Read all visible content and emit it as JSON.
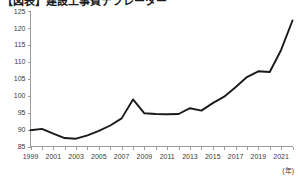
{
  "chart_data": {
    "type": "line",
    "title": "【図表】建設工事費デフレーター",
    "xlabel": "(年)",
    "ylabel": "",
    "ylim": [
      85,
      125
    ],
    "ytick_step": 5,
    "yticks": [
      85,
      90,
      95,
      100,
      105,
      110,
      115,
      120,
      125
    ],
    "xlim": [
      1999,
      2022
    ],
    "xticks_labeled": [
      "1999",
      "2001",
      "2003",
      "2005",
      "2007",
      "2009",
      "2011",
      "2013",
      "2015",
      "2017",
      "2019",
      "2021"
    ],
    "x": [
      1999,
      2000,
      2001,
      2002,
      2003,
      2004,
      2005,
      2006,
      2007,
      2008,
      2009,
      2010,
      2011,
      2012,
      2013,
      2014,
      2015,
      2016,
      2017,
      2018,
      2019,
      2020,
      2021,
      2022
    ],
    "values": [
      89.8,
      90.2,
      88.8,
      87.5,
      87.3,
      88.3,
      89.6,
      91.2,
      93.3,
      98.9,
      94.8,
      94.6,
      94.5,
      94.6,
      96.3,
      95.6,
      97.8,
      99.7,
      102.5,
      105.5,
      107.2,
      107.0,
      113.5,
      122.2
    ],
    "grid": false,
    "legend": "none",
    "line_color": "#1a1a1a",
    "axis_color": "#9a9a9a",
    "background": "#ffffff"
  },
  "axis": {
    "unit_note": "(年)"
  }
}
